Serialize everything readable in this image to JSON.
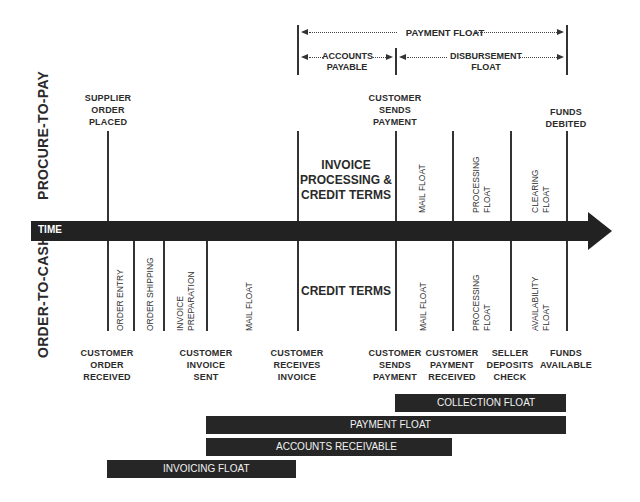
{
  "top_spans": {
    "payment_float": "PAYMENT FLOAT",
    "accounts_payable": [
      "ACCOUNTS",
      "PAYABLE"
    ],
    "disbursement_float": [
      "DISBURSEMENT",
      "FLOAT"
    ]
  },
  "side_labels": {
    "procure_to_pay": "PROCURE-TO-PAY",
    "order_to_cash": "ORDER-TO-CASH"
  },
  "timeline": {
    "label": "TIME",
    "bar_color": "#222222"
  },
  "procure_events": [
    {
      "lines": [
        "SUPPLIER",
        "ORDER",
        "PLACED"
      ]
    },
    {
      "lines": [
        "CUSTOMER",
        "SENDS",
        "PAYMENT"
      ]
    },
    {
      "lines": [
        "FUNDS",
        "DEBITED"
      ]
    }
  ],
  "procure_periods": {
    "invoice_processing": [
      "INVOICE",
      "PROCESSING &",
      "CREDIT TERMS"
    ],
    "mail_float": [
      "MAIL FLOAT"
    ],
    "processing_float": [
      "PROCESSING",
      "FLOAT"
    ],
    "clearing_float": [
      "CLEARING",
      "FLOAT"
    ]
  },
  "cash_periods": {
    "order_entry": [
      "ORDER ENTRY"
    ],
    "order_shipping": [
      "ORDER SHIPPING"
    ],
    "invoice_preparation": [
      "INVOICE",
      "PREPARATION"
    ],
    "mail_float_1": [
      "MAIL FLOAT"
    ],
    "credit_terms": "CREDIT TERMS",
    "mail_float_2": [
      "MAIL FLOAT"
    ],
    "processing_float": [
      "PROCESSING",
      "FLOAT"
    ],
    "availability_float": [
      "AVAILABILITY",
      "FLOAT"
    ]
  },
  "cash_events": [
    {
      "lines": [
        "CUSTOMER",
        "ORDER",
        "RECEIVED"
      ]
    },
    {
      "lines": [
        "CUSTOMER",
        "INVOICE",
        "SENT"
      ]
    },
    {
      "lines": [
        "CUSTOMER",
        "RECEIVES",
        "INVOICE"
      ]
    },
    {
      "lines": [
        "CUSTOMER",
        "SENDS",
        "PAYMENT"
      ]
    },
    {
      "lines": [
        "CUSTOMER",
        "PAYMENT",
        "RECEIVED"
      ]
    },
    {
      "lines": [
        "SELLER",
        "DEPOSITS",
        "CHECK"
      ]
    },
    {
      "lines": [
        "FUNDS",
        "AVAILABLE"
      ]
    }
  ],
  "bottom_bars": [
    {
      "label": "COLLECTION FLOAT"
    },
    {
      "label": "PAYMENT FLOAT"
    },
    {
      "label": "ACCOUNTS RECEIVABLE"
    },
    {
      "label": "INVOICING FLOAT"
    }
  ]
}
